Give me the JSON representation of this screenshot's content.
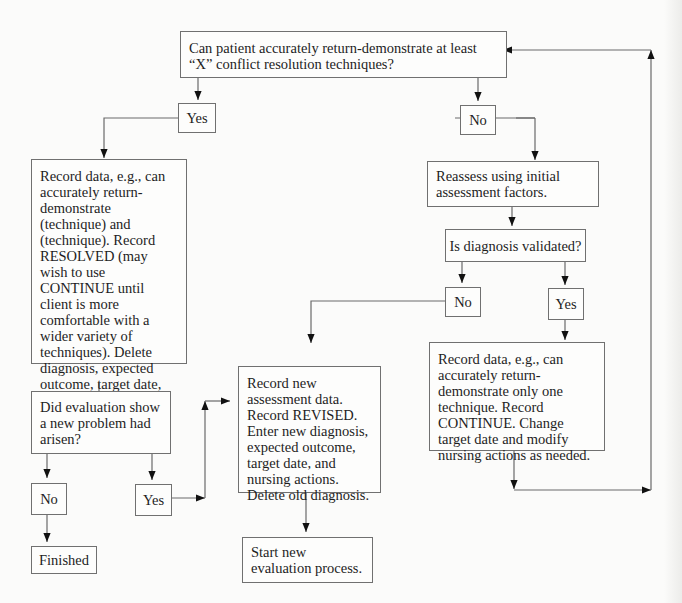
{
  "diagram": {
    "type": "flowchart",
    "nodes": {
      "q_demo": "Can patient accurately return-demonstrate at least “X” conflict resolution techniques?",
      "yes_1": "Yes",
      "no_1": "No",
      "record_resolved": "Record data, e.g., can accurately return-demonstrate (technique) and (technique). Record RESOLVED (may wish to use CONTINUE until client is more comfortable with a wider variety of techniques). Delete diagnosis, expected outcome, target date, and nursing actions.",
      "reassess": "Reassess using initial assessment factors.",
      "q_validated": "Is diagnosis validated?",
      "no_2": "No",
      "yes_2": "Yes",
      "record_continue": "Record data, e.g., can accurately return-demonstrate only one technique. Record CONTINUE. Change target date and modify nursing actions as needed.",
      "q_new_problem": "Did evaluation show a new problem had arisen?",
      "no_3": "No",
      "yes_3": "Yes",
      "finished": "Finished",
      "record_revised": "Record new assessment data. Record REVISED. Enter new diagnosis, expected outcome, target date, and nursing actions. Delete old diagnosis.",
      "start_new": "Start new evaluation process."
    },
    "edges": [
      [
        "q_demo",
        "yes_1"
      ],
      [
        "q_demo",
        "no_1"
      ],
      [
        "yes_1",
        "record_resolved"
      ],
      [
        "no_1",
        "reassess"
      ],
      [
        "reassess",
        "q_validated"
      ],
      [
        "q_validated",
        "no_2"
      ],
      [
        "q_validated",
        "yes_2"
      ],
      [
        "no_2",
        "record_revised"
      ],
      [
        "yes_2",
        "record_continue"
      ],
      [
        "record_continue",
        "q_demo"
      ],
      [
        "record_resolved",
        "q_new_problem"
      ],
      [
        "q_new_problem",
        "no_3"
      ],
      [
        "q_new_problem",
        "yes_3"
      ],
      [
        "no_3",
        "finished"
      ],
      [
        "yes_3",
        "record_revised"
      ],
      [
        "record_revised",
        "start_new"
      ]
    ]
  }
}
